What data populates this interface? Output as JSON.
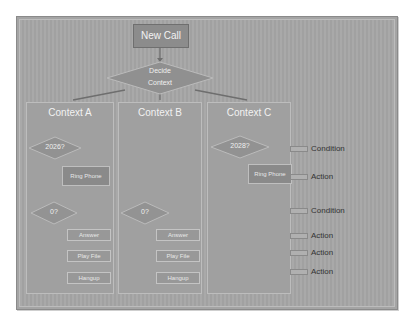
{
  "diagram": {
    "start_node": "New Call",
    "decision_root": [
      "Decide",
      "Context"
    ],
    "contexts": [
      {
        "title": "Context A",
        "condition_1": "2026?",
        "action_1": "Ring Phone",
        "condition_2": "0?",
        "actions": [
          "Answer",
          "Play File",
          "Hangup"
        ]
      },
      {
        "title": "Context B",
        "condition_2": "0?",
        "actions": [
          "Answer",
          "Play File",
          "Hangup"
        ]
      },
      {
        "title": "Context C",
        "condition_1": "2028?",
        "action_1": "Ring Phone"
      }
    ],
    "legend": [
      "Condition",
      "Action",
      "Condition",
      "Action",
      "Action",
      "Action"
    ]
  },
  "colors": {
    "background": "#a6a6a6",
    "node": "#8c8c8c",
    "text": "#f0f0f0",
    "legend_text": "#333333"
  }
}
